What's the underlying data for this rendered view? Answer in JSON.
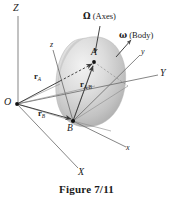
{
  "figure": {
    "caption": "Figure 7/11",
    "colors": {
      "line": "#6b6b6b",
      "text": "#1a1a1a",
      "body_fill_light": "#e8e8e8",
      "body_fill_mid": "#cfcfcf",
      "body_fill_dark": "#a9a9a9",
      "background": "#ffffff"
    }
  },
  "labels": {
    "axis_Z": "Z",
    "axis_Y": "Y",
    "axis_X": "X",
    "axis_z": "z",
    "axis_y": "y",
    "axis_x": "x",
    "origin_O": "O",
    "point_A": "A",
    "point_B": "B",
    "vector_rA": "r",
    "vector_rA_sub": "A",
    "vector_rB": "r",
    "vector_rB_sub": "B",
    "vector_rAB": "r",
    "vector_rAB_sub": "A/B",
    "omega_capital": "Ω",
    "omega_capital_note": "(Axes)",
    "omega_lower": "ω",
    "omega_lower_note": "(Body)"
  },
  "geometry": {
    "origin_O": [
      17,
      104
    ],
    "point_A": [
      94,
      62
    ],
    "point_B": [
      73,
      121
    ],
    "Z_axis_end": [
      18,
      16
    ],
    "Y_axis_end": [
      158,
      75
    ],
    "X_axis_end": [
      78,
      168
    ],
    "z_axis_end": [
      53,
      50
    ],
    "y_axis_end": [
      140,
      55
    ],
    "x_axis_end": [
      126,
      147
    ],
    "omega_capital_arrow": [
      [
        100,
        26
      ],
      [
        95,
        54
      ]
    ],
    "omega_lower_arrow": [
      [
        116,
        56
      ],
      [
        131,
        39
      ]
    ]
  }
}
